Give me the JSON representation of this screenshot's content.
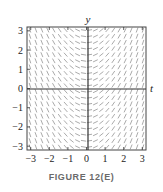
{
  "figure": {
    "caption": "FIGURE 12(E)",
    "x_axis_label": "t",
    "y_axis_label": "y",
    "x_ticks": [
      "−3",
      "−2",
      "−1",
      "0",
      "1",
      "2",
      "3"
    ],
    "y_ticks": [
      "3",
      "2",
      "1",
      "0",
      "−1",
      "−2",
      "−3"
    ],
    "colors": {
      "axis": "#333333",
      "segment": "#555555",
      "frame": "#444444",
      "text": "#222222"
    }
  },
  "chart_data": {
    "type": "slope_field",
    "title": "",
    "xlabel": "t",
    "ylabel": "y",
    "xlim": [
      -3.2,
      3.2
    ],
    "ylim": [
      -3.2,
      3.2
    ],
    "x_ticks": [
      -3,
      -2,
      -1,
      0,
      1,
      2,
      3
    ],
    "y_ticks": [
      -3,
      -2,
      -1,
      0,
      1,
      2,
      3
    ],
    "slope_function": "dy/dt = t",
    "grid": false
  }
}
